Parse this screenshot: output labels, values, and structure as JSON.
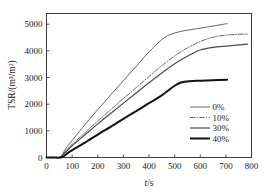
{
  "chart_data": {
    "type": "line",
    "title": "",
    "xlabel": "t/s",
    "ylabel": "TSR/(m3/m2)",
    "ylabel_display": "TSR/(m³/m²)",
    "xlim": [
      0,
      800
    ],
    "ylim": [
      0,
      5400
    ],
    "xticks": [
      0,
      100,
      200,
      300,
      400,
      500,
      600,
      700,
      800
    ],
    "yticks": [
      0,
      1000,
      2000,
      3000,
      4000,
      5000
    ],
    "xtick_labels": [
      "0",
      "100",
      "200",
      "300",
      "400",
      "500",
      "600",
      "700",
      "800"
    ],
    "ytick_labels": [
      "0",
      "1000",
      "2000",
      "3000",
      "4000",
      "5000"
    ],
    "grid": false,
    "legend_position": "right-middle",
    "series": [
      {
        "name": "0%",
        "label": "0%",
        "style": "solid",
        "width": 0.9,
        "color": "#555555",
        "x": [
          0,
          30,
          55,
          75,
          100,
          150,
          200,
          250,
          300,
          350,
          400,
          450,
          480,
          520,
          560,
          600,
          650,
          705
        ],
        "y": [
          0,
          0,
          30,
          330,
          640,
          1230,
          1800,
          2340,
          2880,
          3420,
          3960,
          4420,
          4600,
          4720,
          4790,
          4850,
          4930,
          5020
        ]
      },
      {
        "name": "10%",
        "label": "10%",
        "style": "dashdot",
        "width": 0.9,
        "color": "#555555",
        "x": [
          0,
          30,
          55,
          80,
          100,
          150,
          200,
          250,
          300,
          350,
          400,
          450,
          500,
          550,
          600,
          650,
          700,
          750,
          785
        ],
        "y": [
          0,
          0,
          20,
          300,
          490,
          930,
          1370,
          1790,
          2210,
          2620,
          3040,
          3440,
          3810,
          4110,
          4350,
          4510,
          4590,
          4620,
          4630
        ]
      },
      {
        "name": "30%",
        "label": "30%",
        "style": "solid",
        "width": 1.2,
        "color": "#4a4a4a",
        "x": [
          0,
          30,
          55,
          80,
          100,
          150,
          200,
          250,
          300,
          350,
          400,
          450,
          500,
          550,
          600,
          650,
          700,
          750,
          785
        ],
        "y": [
          0,
          0,
          15,
          260,
          440,
          850,
          1260,
          1650,
          2040,
          2420,
          2800,
          3170,
          3520,
          3800,
          4030,
          4130,
          4180,
          4220,
          4250
        ]
      },
      {
        "name": "40%",
        "label": "40%",
        "style": "solid",
        "width": 2.0,
        "color": "#111111",
        "x": [
          0,
          30,
          60,
          85,
          110,
          150,
          200,
          250,
          300,
          350,
          400,
          450,
          500,
          525,
          560,
          600,
          650,
          705
        ],
        "y": [
          0,
          0,
          10,
          180,
          330,
          560,
          860,
          1150,
          1450,
          1740,
          2040,
          2330,
          2690,
          2810,
          2860,
          2880,
          2900,
          2920
        ]
      }
    ]
  },
  "legend": {
    "entries": [
      {
        "label": "0%"
      },
      {
        "label": "10%"
      },
      {
        "label": "30%"
      },
      {
        "label": "40%"
      }
    ]
  },
  "axes": {
    "x_title_prefix": "t",
    "x_title_suffix": "/s",
    "y_title": "TSR/(m³/m²)"
  }
}
